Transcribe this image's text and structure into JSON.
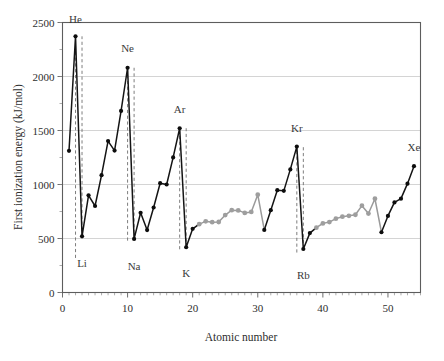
{
  "chart_data": {
    "type": "line",
    "title": "",
    "xlabel": "Atomic number",
    "ylabel": "First ionization energy (kJ/mol)",
    "xlim": [
      0,
      55
    ],
    "ylim": [
      0,
      2500
    ],
    "xticks": [
      0,
      10,
      20,
      30,
      40,
      50
    ],
    "xtick_labels": [
      "0",
      "10",
      "20",
      "30",
      "40",
      "50"
    ],
    "yticks": [
      0,
      500,
      1000,
      1500,
      2000,
      2500
    ],
    "ytick_labels": [
      "0",
      "500",
      "1000",
      "1500",
      "2000",
      "2500"
    ],
    "grid": "horizontal",
    "legend": "none",
    "x": [
      1,
      2,
      3,
      4,
      5,
      6,
      7,
      8,
      9,
      10,
      11,
      12,
      13,
      14,
      15,
      16,
      17,
      18,
      19,
      20,
      21,
      22,
      23,
      24,
      25,
      26,
      27,
      28,
      29,
      30,
      31,
      32,
      33,
      34,
      35,
      36,
      37,
      38,
      39,
      40,
      41,
      42,
      43,
      44,
      45,
      46,
      47,
      48,
      49,
      50,
      51,
      52,
      53,
      54
    ],
    "values": [
      1312,
      2372,
      520,
      900,
      801,
      1086,
      1402,
      1314,
      1681,
      2081,
      496,
      738,
      578,
      787,
      1012,
      1000,
      1251,
      1521,
      419,
      590,
      633,
      659,
      651,
      653,
      717,
      762,
      760,
      737,
      746,
      906,
      579,
      762,
      947,
      941,
      1140,
      1351,
      403,
      550,
      600,
      640,
      652,
      684,
      702,
      710,
      720,
      804,
      731,
      868,
      558,
      709,
      834,
      869,
      1008,
      1170
    ],
    "element_symbols": [
      "H",
      "He",
      "Li",
      "Be",
      "B",
      "C",
      "N",
      "O",
      "F",
      "Ne",
      "Na",
      "Mg",
      "Al",
      "Si",
      "P",
      "S",
      "Cl",
      "Ar",
      "K",
      "Ca",
      "Sc",
      "Ti",
      "V",
      "Cr",
      "Mn",
      "Fe",
      "Co",
      "Ni",
      "Cu",
      "Zn",
      "Ga",
      "Ge",
      "As",
      "Se",
      "Br",
      "Kr",
      "Rb",
      "Sr",
      "Y",
      "Zr",
      "Nb",
      "Mo",
      "Tc",
      "Ru",
      "Rh",
      "Pd",
      "Ag",
      "Cd",
      "In",
      "Sn",
      "Sb",
      "Te",
      "I",
      "Xe"
    ],
    "transition_metal_indices": [
      20,
      21,
      22,
      23,
      24,
      25,
      26,
      27,
      28,
      29,
      38,
      39,
      40,
      41,
      42,
      43,
      44,
      45,
      46,
      47
    ],
    "annotations": [
      {
        "label": "He",
        "x": 2,
        "y": 2372,
        "label_y": 2500,
        "leader_to_y": 320
      },
      {
        "label": "Ne",
        "x": 10,
        "y": 2081,
        "label_y": 2230,
        "leader_to_y": 480
      },
      {
        "label": "Ar",
        "x": 18,
        "y": 1521,
        "label_y": 1660,
        "leader_to_y": 400
      },
      {
        "label": "Kr",
        "x": 36,
        "y": 1351,
        "label_y": 1490,
        "leader_to_y": 370
      },
      {
        "label": "Xe",
        "x": 54,
        "y": 1170,
        "label_y": 1310,
        "leader_to_y": 1170
      },
      {
        "label": "Li",
        "x": 3,
        "y": 520,
        "label_y": 330,
        "leader_to_y": 2372
      },
      {
        "label": "Na",
        "x": 11,
        "y": 496,
        "label_y": 305,
        "leader_to_y": 2081
      },
      {
        "label": "K",
        "x": 19,
        "y": 419,
        "label_y": 235,
        "leader_to_y": 1521
      },
      {
        "label": "Rb",
        "x": 37,
        "y": 403,
        "label_y": 215,
        "leader_to_y": 1351
      }
    ]
  }
}
